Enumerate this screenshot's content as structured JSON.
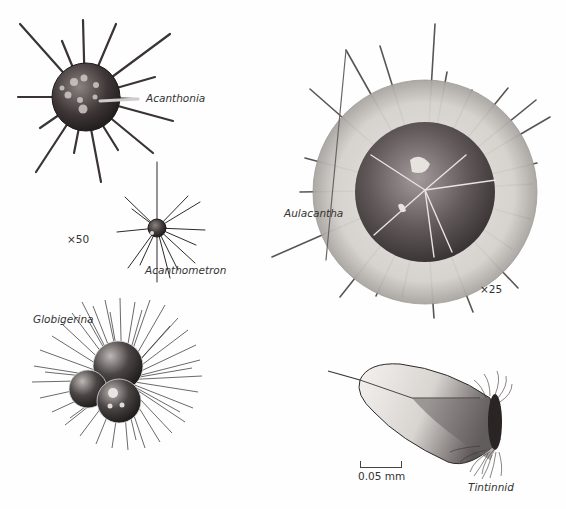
{
  "figure": {
    "organisms": [
      {
        "id": "acanthonia",
        "label": "Acanthonia"
      },
      {
        "id": "acanthometron",
        "label": "Acanthometron"
      },
      {
        "id": "aulacantha",
        "label": "Aulacantha"
      },
      {
        "id": "globigerina",
        "label": "Globigerina"
      },
      {
        "id": "tintinnid",
        "label": "Tintinnid"
      }
    ],
    "magnifications": {
      "left": "×50",
      "right": "×25"
    },
    "scale_bar": {
      "label": "0.05 mm"
    },
    "colors": {
      "ink": "#2a2a2a",
      "body_dark": "#3a3434",
      "shell": "#d8d4d0",
      "background": "#fefefe"
    }
  }
}
